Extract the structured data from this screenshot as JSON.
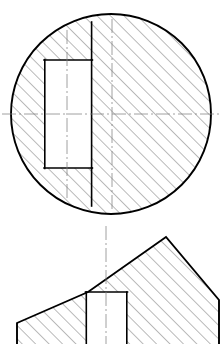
{
  "drawing": {
    "title": "Engineering Section Drawing",
    "background_color": "#ffffff",
    "outline_color": "#000000",
    "hatch_color": "#4a4a4a",
    "centerline_color": "#777777",
    "outline_width": 1.9,
    "inner_outline_width": 1.5,
    "hatch_width": 0.75,
    "centerline_width": 0.7,
    "hatch_angle_deg": 45,
    "hatch_spacing": 9.5,
    "views": [
      {
        "name": "top-circular-section-view",
        "type": "full-section-circle",
        "circle": {
          "center_x": 111,
          "center_y": 114,
          "radius": 100,
          "top_y": 14,
          "bottom_y": 214,
          "left_x": 11,
          "right_x": 211
        },
        "slot": {
          "name": "keyway-slot",
          "left_x": 44,
          "right_x": 92,
          "top_y": 60,
          "bottom_y": 168,
          "upper_step_top_y": 22,
          "lower_step_bottom_y": 206
        },
        "centerlines": [
          {
            "name": "horizontal-centerline",
            "x1": 2,
            "y1": 114,
            "x2": 219,
            "y2": 114
          },
          {
            "name": "vertical-centerline-main",
            "x1": 112,
            "y1": 19,
            "x2": 112,
            "y2": 210
          },
          {
            "name": "vertical-centerline-slot",
            "x1": 67,
            "y1": 30,
            "x2": 67,
            "y2": 198
          }
        ]
      },
      {
        "name": "bottom-angled-section-view",
        "type": "partial-section-chamfered",
        "profile_points": "17,323 17,344 219,344 219,300 166,237 88,292 17,323",
        "apex_x": 166,
        "apex_y": 237,
        "left_corner_x": 17,
        "left_corner_y": 323,
        "slot": {
          "name": "bottom-keyway-slot",
          "left_x": 86,
          "right_x": 127,
          "top_y": 292,
          "bottom_y": 344
        },
        "centerlines": [
          {
            "name": "vertical-centerline-bottom",
            "x1": 106,
            "y1": 226,
            "x2": 106,
            "y2": 344
          }
        ]
      }
    ],
    "separator": {
      "name": "view-separator-gap",
      "y": 220
    }
  }
}
